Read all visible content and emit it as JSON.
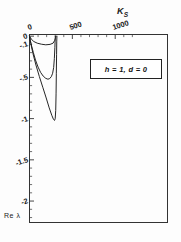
{
  "figure": {
    "background": "#fdfdfd",
    "frame_color": "#333333",
    "curve_color": "#1a1a1a"
  },
  "annotation": {
    "legend_text": "h = 1, d = 0",
    "ylabel_corner": "Re λ"
  },
  "chart_data": {
    "type": "line",
    "title": "",
    "xlabel": "K_S",
    "xlabel_display": "K",
    "xlabel_sub": "S",
    "ylabel": "Re λ",
    "xlim": [
      0,
      1610
    ],
    "ylim": [
      -2.26,
      0.02
    ],
    "grid": false,
    "legend_position": "upper-right-inside",
    "xaxis_position": "top",
    "yaxis_position": "left",
    "xticks": [
      0,
      500,
      1000
    ],
    "xtick_labels": [
      "0",
      "500",
      "1000"
    ],
    "xminor_step": 100,
    "yticks": [
      0,
      -0.1,
      -0.5,
      -1,
      -1.5,
      -2
    ],
    "ytick_labels": [
      "0",
      "-.1",
      "-.5",
      "-1",
      "-1.5",
      "-2"
    ],
    "yminor_step": 0.1,
    "annotations": [
      {
        "text": "h = 1, d = 0",
        "x": 1120,
        "y": -0.38
      }
    ],
    "series": [
      {
        "name": "upper-branch",
        "comment": "shallow branch: drops from 0 to about -0.52 then recovers to 0",
        "points": [
          [
            0,
            0.0
          ],
          [
            10,
            -0.055
          ],
          [
            25,
            -0.12
          ],
          [
            45,
            -0.2
          ],
          [
            70,
            -0.29
          ],
          [
            100,
            -0.375
          ],
          [
            130,
            -0.44
          ],
          [
            160,
            -0.485
          ],
          [
            190,
            -0.512
          ],
          [
            215,
            -0.522
          ],
          [
            235,
            -0.515
          ],
          [
            255,
            -0.49
          ],
          [
            270,
            -0.45
          ],
          [
            282,
            -0.38
          ],
          [
            290,
            -0.27
          ],
          [
            296,
            -0.14
          ],
          [
            300,
            -0.03
          ],
          [
            302,
            0.0
          ]
        ]
      },
      {
        "name": "lower-branch",
        "comment": "deep branch: descends steeply from 0 to about -1.02 then rises sharply back to 0",
        "points": [
          [
            0,
            0.0
          ],
          [
            15,
            -0.09
          ],
          [
            40,
            -0.21
          ],
          [
            75,
            -0.35
          ],
          [
            115,
            -0.49
          ],
          [
            155,
            -0.62
          ],
          [
            195,
            -0.75
          ],
          [
            230,
            -0.87
          ],
          [
            260,
            -0.96
          ],
          [
            280,
            -1.01
          ],
          [
            292,
            -1.022
          ],
          [
            300,
            -1.0
          ],
          [
            306,
            -0.9
          ],
          [
            310,
            -0.7
          ],
          [
            313,
            -0.45
          ],
          [
            316,
            -0.22
          ],
          [
            318,
            -0.06
          ],
          [
            320,
            0.0
          ]
        ]
      },
      {
        "name": "near-zero-branch",
        "comment": "very shallow branch hugging the top axis near the origin",
        "points": [
          [
            0,
            0.0
          ],
          [
            20,
            -0.035
          ],
          [
            50,
            -0.065
          ],
          [
            90,
            -0.085
          ],
          [
            140,
            -0.098
          ],
          [
            190,
            -0.105
          ],
          [
            240,
            -0.1
          ],
          [
            275,
            -0.085
          ],
          [
            295,
            -0.05
          ],
          [
            305,
            -0.015
          ],
          [
            310,
            0.0
          ]
        ]
      }
    ]
  }
}
